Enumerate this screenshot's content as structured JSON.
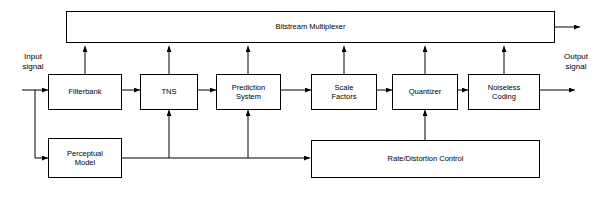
{
  "diagram": {
    "title_block": {
      "label": "Bitstream Multiplexer"
    },
    "io_labels": {
      "input": "Input\nsignal",
      "output": "Output\nsignal"
    },
    "blocks": [
      {
        "id": "filterbank",
        "label": "Filterbank"
      },
      {
        "id": "tns",
        "label": "TNS"
      },
      {
        "id": "prediction",
        "label": "Prediction\nSystem"
      },
      {
        "id": "scale-factors",
        "label": "Scale\nFactors"
      },
      {
        "id": "quantizer",
        "label": "Quantizer"
      },
      {
        "id": "noiseless-coding",
        "label": "Noiseless\nCoding"
      },
      {
        "id": "perceptual-model",
        "label": "Perceptual\nModel"
      },
      {
        "id": "rate-distortion-control",
        "label": "Rate/Distortion Control"
      }
    ],
    "colors": {
      "stroke": "#000000",
      "background": "#ffffff",
      "text": "#000000"
    }
  }
}
